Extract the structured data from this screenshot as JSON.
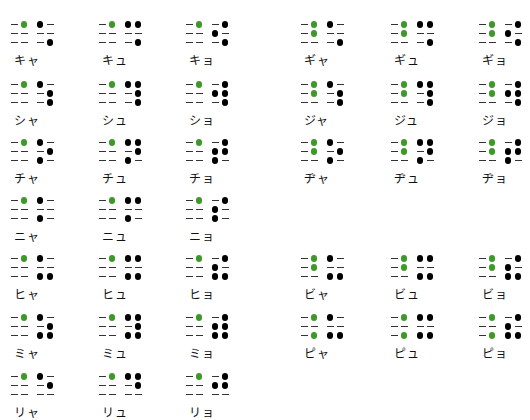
{
  "colors": {
    "prefix_dot": "#3d9a2a",
    "dot": "#000000",
    "empty": "#333333"
  },
  "prefixes": {
    "yoon": [
      4
    ],
    "yoon_dakuten": [
      4,
      5
    ],
    "yoon_handakuten": [
      4,
      6
    ]
  },
  "items": [
    {
      "label": "キャ",
      "col": 0,
      "row": 0,
      "prefix": [
        4
      ],
      "dots": [
        1,
        6
      ]
    },
    {
      "label": "キュ",
      "col": 1,
      "row": 0,
      "prefix": [
        4
      ],
      "dots": [
        1,
        4,
        6
      ]
    },
    {
      "label": "キョ",
      "col": 2,
      "row": 0,
      "prefix": [
        4
      ],
      "dots": [
        4,
        2,
        6
      ]
    },
    {
      "label": "ギャ",
      "col": 3,
      "row": 0,
      "prefix": [
        4,
        5
      ],
      "dots": [
        1,
        6
      ]
    },
    {
      "label": "ギュ",
      "col": 4,
      "row": 0,
      "prefix": [
        4,
        5
      ],
      "dots": [
        1,
        4,
        6
      ]
    },
    {
      "label": "ギョ",
      "col": 5,
      "row": 0,
      "prefix": [
        4,
        5
      ],
      "dots": [
        4,
        2,
        6
      ]
    },
    {
      "label": "シャ",
      "col": 0,
      "row": 1,
      "prefix": [
        4
      ],
      "dots": [
        1,
        5,
        6
      ]
    },
    {
      "label": "シュ",
      "col": 1,
      "row": 1,
      "prefix": [
        4
      ],
      "dots": [
        1,
        4,
        5,
        6
      ]
    },
    {
      "label": "ショ",
      "col": 2,
      "row": 1,
      "prefix": [
        4
      ],
      "dots": [
        4,
        2,
        5,
        6
      ]
    },
    {
      "label": "ジャ",
      "col": 3,
      "row": 1,
      "prefix": [
        4,
        5
      ],
      "dots": [
        1,
        5,
        6
      ]
    },
    {
      "label": "ジュ",
      "col": 4,
      "row": 1,
      "prefix": [
        4,
        5
      ],
      "dots": [
        1,
        4,
        5,
        6
      ]
    },
    {
      "label": "ジョ",
      "col": 5,
      "row": 1,
      "prefix": [
        4,
        5
      ],
      "dots": [
        4,
        2,
        5,
        6
      ]
    },
    {
      "label": "チャ",
      "col": 0,
      "row": 2,
      "prefix": [
        4
      ],
      "dots": [
        1,
        5,
        3
      ]
    },
    {
      "label": "チュ",
      "col": 1,
      "row": 2,
      "prefix": [
        4
      ],
      "dots": [
        1,
        4,
        5,
        3
      ]
    },
    {
      "label": "チョ",
      "col": 2,
      "row": 2,
      "prefix": [
        4
      ],
      "dots": [
        4,
        2,
        5,
        3
      ]
    },
    {
      "label": "ヂャ",
      "col": 3,
      "row": 2,
      "prefix": [
        4,
        5
      ],
      "dots": [
        1,
        5,
        3
      ]
    },
    {
      "label": "ヂュ",
      "col": 4,
      "row": 2,
      "prefix": [
        4,
        5
      ],
      "dots": [
        1,
        4,
        5,
        3
      ]
    },
    {
      "label": "ヂョ",
      "col": 5,
      "row": 2,
      "prefix": [
        4,
        5
      ],
      "dots": [
        4,
        2,
        5,
        3
      ]
    },
    {
      "label": "ニャ",
      "col": 0,
      "row": 3,
      "prefix": [
        4
      ],
      "dots": [
        1,
        3
      ]
    },
    {
      "label": "ニュ",
      "col": 1,
      "row": 3,
      "prefix": [
        4
      ],
      "dots": [
        1,
        4,
        3
      ]
    },
    {
      "label": "ニョ",
      "col": 2,
      "row": 3,
      "prefix": [
        4
      ],
      "dots": [
        4,
        2,
        3
      ]
    },
    {
      "label": "ヒャ",
      "col": 0,
      "row": 4,
      "prefix": [
        4
      ],
      "dots": [
        1,
        3,
        6
      ]
    },
    {
      "label": "ヒュ",
      "col": 1,
      "row": 4,
      "prefix": [
        4
      ],
      "dots": [
        1,
        4,
        3,
        6
      ]
    },
    {
      "label": "ヒョ",
      "col": 2,
      "row": 4,
      "prefix": [
        4
      ],
      "dots": [
        4,
        2,
        3,
        6
      ]
    },
    {
      "label": "ビャ",
      "col": 3,
      "row": 4,
      "prefix": [
        4,
        5
      ],
      "dots": [
        1,
        3,
        6
      ]
    },
    {
      "label": "ビュ",
      "col": 4,
      "row": 4,
      "prefix": [
        4,
        5
      ],
      "dots": [
        1,
        4,
        3,
        6
      ]
    },
    {
      "label": "ビョ",
      "col": 5,
      "row": 4,
      "prefix": [
        4,
        5
      ],
      "dots": [
        4,
        2,
        3,
        6
      ]
    },
    {
      "label": "ミャ",
      "col": 0,
      "row": 5,
      "prefix": [
        4
      ],
      "dots": [
        1,
        5,
        3,
        6
      ]
    },
    {
      "label": "ミュ",
      "col": 1,
      "row": 5,
      "prefix": [
        4
      ],
      "dots": [
        1,
        4,
        5,
        3,
        6
      ]
    },
    {
      "label": "ミョ",
      "col": 2,
      "row": 5,
      "prefix": [
        4
      ],
      "dots": [
        4,
        2,
        5,
        3,
        6
      ]
    },
    {
      "label": "ピャ",
      "col": 3,
      "row": 5,
      "prefix": [
        4,
        6
      ],
      "dots": [
        1,
        3,
        6
      ]
    },
    {
      "label": "ピュ",
      "col": 4,
      "row": 5,
      "prefix": [
        4,
        6
      ],
      "dots": [
        1,
        4,
        3,
        6
      ]
    },
    {
      "label": "ピョ",
      "col": 5,
      "row": 5,
      "prefix": [
        4,
        6
      ],
      "dots": [
        4,
        2,
        3,
        6
      ]
    },
    {
      "label": "リャ",
      "col": 0,
      "row": 6,
      "prefix": [
        4
      ],
      "dots": [
        1,
        5
      ]
    },
    {
      "label": "リュ",
      "col": 1,
      "row": 6,
      "prefix": [
        4
      ],
      "dots": [
        1,
        4,
        5
      ]
    },
    {
      "label": "リョ",
      "col": 2,
      "row": 6,
      "prefix": [
        4
      ],
      "dots": [
        4,
        2,
        5
      ]
    }
  ]
}
